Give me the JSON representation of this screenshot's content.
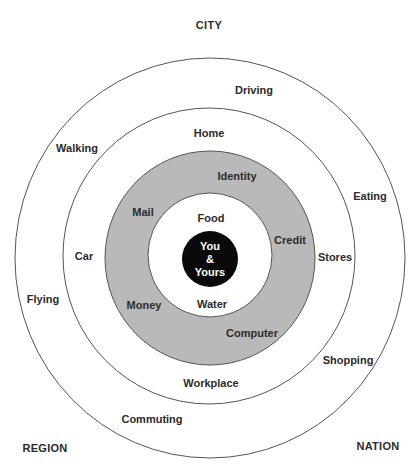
{
  "corners": {
    "top": "CITY",
    "bottom_left": "REGION",
    "bottom_right": "NATION"
  },
  "center": {
    "line1": "You",
    "line2": "&",
    "line3": "Yours"
  },
  "rings": {
    "inner_white": [
      "Food",
      "Water"
    ],
    "gray": [
      "Identity",
      "Mail",
      "Credit",
      "Money",
      "Computer"
    ],
    "middle_white": [
      "Home",
      "Car",
      "Stores",
      "Workplace",
      "Shopping"
    ],
    "outer": [
      "Driving",
      "Walking",
      "Eating",
      "Flying",
      "Commuting"
    ]
  },
  "labels": {
    "food": "Food",
    "water": "Water",
    "identity": "Identity",
    "mail": "Mail",
    "credit": "Credit",
    "money": "Money",
    "computer": "Computer",
    "home": "Home",
    "car": "Car",
    "stores": "Stores",
    "workplace": "Workplace",
    "shopping": "Shopping",
    "driving": "Driving",
    "walking": "Walking",
    "eating": "Eating",
    "flying": "Flying",
    "commuting": "Commuting"
  },
  "colors": {
    "ring_fill_gray": "#b9b9b9",
    "center_fill": "#0a0a0a",
    "stroke": "#555555",
    "background": "#ffffff"
  }
}
